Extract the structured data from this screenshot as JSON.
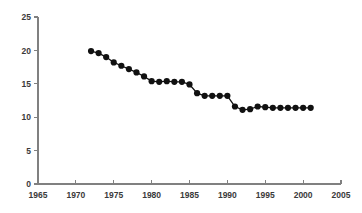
{
  "chart_data": {
    "type": "line",
    "title": "",
    "subtitle": "",
    "xlabel": "",
    "ylabel": "",
    "xlim": [
      1965,
      2005
    ],
    "ylim": [
      0,
      25
    ],
    "xticks": [
      1965,
      1970,
      1975,
      1980,
      1985,
      1990,
      1995,
      2000,
      2005
    ],
    "yticks": [
      0,
      5,
      10,
      15,
      20,
      25
    ],
    "xtick_labels": [
      "1965",
      "1970",
      "1975",
      "1980",
      "1985",
      "1990",
      "1995",
      "2000",
      "2005"
    ],
    "ytick_labels": [
      "0",
      "5",
      "10",
      "15",
      "20",
      "25"
    ],
    "grid": false,
    "legend": false,
    "legend_position": "none",
    "marker": "filled-circle",
    "marker_color": "#111111",
    "line_color": "#111111",
    "axis_color": "#808080",
    "background_color": "#ffffff",
    "x": [
      1972,
      1973,
      1974,
      1975,
      1976,
      1977,
      1978,
      1979,
      1980,
      1981,
      1982,
      1983,
      1984,
      1985,
      1986,
      1987,
      1988,
      1989,
      1990,
      1991,
      1992,
      1993,
      1994,
      1995,
      1996,
      1997,
      1998,
      1999,
      2000,
      2001
    ],
    "values": [
      19.9,
      19.6,
      19.0,
      18.2,
      17.7,
      17.2,
      16.7,
      16.1,
      15.4,
      15.3,
      15.4,
      15.3,
      15.3,
      14.9,
      13.6,
      13.2,
      13.2,
      13.2,
      13.2,
      11.6,
      11.1,
      11.2,
      11.6,
      11.5,
      11.4,
      11.4,
      11.4,
      11.4,
      11.4,
      11.4
    ],
    "series": [
      {
        "name": "series-1",
        "values": [
          19.9,
          19.6,
          19.0,
          18.2,
          17.7,
          17.2,
          16.7,
          16.1,
          15.4,
          15.3,
          15.4,
          15.3,
          15.3,
          14.9,
          13.6,
          13.2,
          13.2,
          13.2,
          13.2,
          11.6,
          11.1,
          11.2,
          11.6,
          11.5,
          11.4,
          11.4,
          11.4,
          11.4,
          11.4,
          11.4
        ]
      }
    ]
  }
}
